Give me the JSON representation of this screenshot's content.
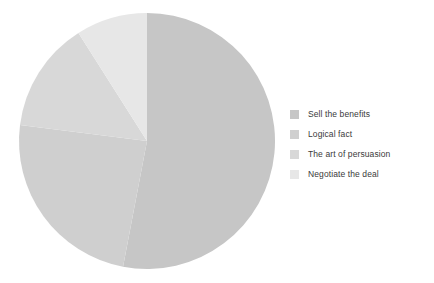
{
  "chart_data": {
    "type": "pie",
    "title": "",
    "subtitle": "",
    "xlabel": "",
    "ylabel": "",
    "grid": false,
    "legend_position": "right",
    "start_angle_deg": 0,
    "direction": "clockwise",
    "center": {
      "x": 147,
      "y": 141
    },
    "radius": 128,
    "categories": [
      "Sell the benefits",
      "Logical fact",
      "The art of persuasion",
      "Negotiate the deal"
    ],
    "values": [
      53,
      24,
      14,
      9
    ],
    "colors": [
      "#c6c6c6",
      "#cfcfcf",
      "#d8d8d8",
      "#e7e7e7"
    ],
    "slices": [
      {
        "label": "Sell the benefits",
        "value": 53,
        "color": "#c6c6c6",
        "start_angle_deg": 0,
        "end_angle_deg": 190.8
      },
      {
        "label": "Logical fact",
        "value": 24,
        "color": "#cfcfcf",
        "start_angle_deg": 190.8,
        "end_angle_deg": 277.2
      },
      {
        "label": "The art of persuasion",
        "value": 14,
        "color": "#d8d8d8",
        "start_angle_deg": 277.2,
        "end_angle_deg": 327.6
      },
      {
        "label": "Negotiate the deal",
        "value": 9,
        "color": "#e7e7e7",
        "start_angle_deg": 327.6,
        "end_angle_deg": 360
      }
    ]
  },
  "legend": {
    "items": [
      {
        "label": "Sell the benefits",
        "color": "#c6c6c6"
      },
      {
        "label": "Logical fact",
        "color": "#cfcfcf"
      },
      {
        "label": "The art of persuasion",
        "color": "#d8d8d8"
      },
      {
        "label": "Negotiate the deal",
        "color": "#e7e7e7"
      }
    ]
  },
  "canvas": {
    "background": "#ffffff",
    "width": 434,
    "height": 283
  }
}
